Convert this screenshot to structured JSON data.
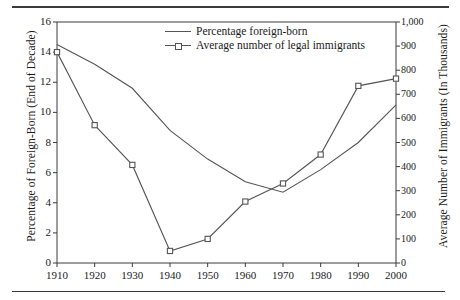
{
  "figure": {
    "has_top_rule": true,
    "has_bottom_rule": true,
    "line_color": "#555555",
    "axis_color": "#3a3a3a"
  },
  "axes": {
    "left_title": "Percentage of Foreign-Born (End of Decade)",
    "right_title": "Average Number of Immigrants (In Thousands)",
    "left_ticks": [
      "0",
      "2",
      "4",
      "6",
      "8",
      "10",
      "12",
      "14",
      "16"
    ],
    "right_ticks": [
      "0",
      "100",
      "200",
      "300",
      "400",
      "500",
      "600",
      "700",
      "800",
      "900",
      "1,000"
    ],
    "x_ticks": [
      "1910",
      "1920",
      "1930",
      "1940",
      "1950",
      "1960",
      "1970",
      "1980",
      "1990",
      "2000"
    ]
  },
  "legend": {
    "items": [
      {
        "label": "Percentage foreign-born",
        "marker": "none"
      },
      {
        "label": "Average number of legal immigrants",
        "marker": "square"
      }
    ]
  },
  "chart_data": {
    "type": "line",
    "title": "",
    "xlabel": "",
    "ylabel": "Percentage of Foreign-Born (End of Decade)",
    "y2label": "Average Number of Immigrants (In Thousands)",
    "x": [
      1910,
      1920,
      1930,
      1940,
      1950,
      1960,
      1970,
      1980,
      1990,
      2000
    ],
    "xlim": [
      1910,
      2000
    ],
    "ylim": [
      0,
      16
    ],
    "y2lim": [
      0,
      1000
    ],
    "grid": false,
    "legend_position": "top-center",
    "series": [
      {
        "name": "Percentage foreign-born",
        "axis": "left",
        "marker": "none",
        "values": [
          14.5,
          13.2,
          11.6,
          8.8,
          6.9,
          5.4,
          4.7,
          6.2,
          8.0,
          10.5
        ]
      },
      {
        "name": "Average number of legal immigrants",
        "axis": "right",
        "marker": "square",
        "values": [
          875,
          572,
          407,
          50,
          100,
          255,
          330,
          450,
          735,
          765
        ]
      }
    ]
  }
}
